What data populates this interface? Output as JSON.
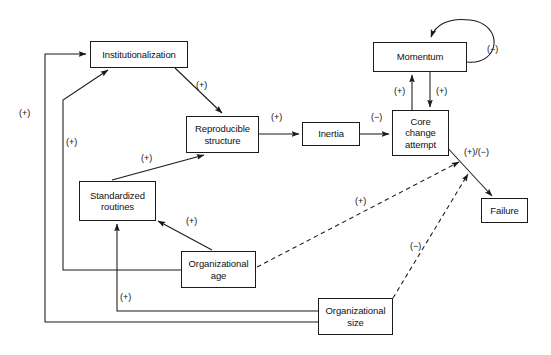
{
  "diagram": {
    "type": "causal-loop-diagram",
    "stroke_color": "#1a1a1a",
    "text_color": "#111111",
    "background": "#ffffff",
    "nodes": [
      {
        "id": "institutionalization",
        "label": "Institutionalization",
        "x": 90,
        "y": 41,
        "w": 98,
        "h": 27
      },
      {
        "id": "reproducible_structure",
        "label": "Reproducible structure",
        "x": 186,
        "y": 116,
        "w": 73,
        "h": 37
      },
      {
        "id": "inertia",
        "label": "Inertia",
        "x": 302,
        "y": 122,
        "w": 58,
        "h": 24
      },
      {
        "id": "core_change_attempt",
        "label": "Core change attempt",
        "x": 392,
        "y": 110,
        "w": 57,
        "h": 46
      },
      {
        "id": "momentum",
        "label": "Momentum",
        "x": 373,
        "y": 42,
        "w": 94,
        "h": 30
      },
      {
        "id": "failure",
        "label": "Failure",
        "x": 481,
        "y": 198,
        "w": 47,
        "h": 25
      },
      {
        "id": "standardized_routines",
        "label": "Standardized routines",
        "x": 79,
        "y": 181,
        "w": 77,
        "h": 40
      },
      {
        "id": "organizational_age",
        "label": "Organizational age",
        "x": 181,
        "y": 251,
        "w": 75,
        "h": 37
      },
      {
        "id": "organizational_size",
        "label": "Organizational size",
        "x": 318,
        "y": 298,
        "w": 75,
        "h": 37
      }
    ],
    "edge_labels": [
      {
        "id": "lbl-inst-repro",
        "text": "(+)",
        "x": 196,
        "y": 80
      },
      {
        "id": "lbl-repro-inertia",
        "text": "(+)",
        "x": 271,
        "y": 112
      },
      {
        "id": "lbl-inertia-core",
        "text": "(−)",
        "x": 371,
        "y": 112
      },
      {
        "id": "lbl-core-momentum",
        "text": "(+)",
        "x": 394,
        "y": 86
      },
      {
        "id": "lbl-momentum-core",
        "text": "(+)",
        "x": 436,
        "y": 86
      },
      {
        "id": "lbl-momentum-self",
        "text": "(−)",
        "x": 487,
        "y": 44
      },
      {
        "id": "lbl-core-failure",
        "text": "(+)/(−)",
        "x": 464,
        "y": 147
      },
      {
        "id": "lbl-size-inst",
        "text": "(+)",
        "x": 19,
        "y": 108
      },
      {
        "id": "lbl-age-inst",
        "text": "(+)",
        "x": 66,
        "y": 137
      },
      {
        "id": "lbl-routines-repro",
        "text": "(+)",
        "x": 141,
        "y": 153
      },
      {
        "id": "lbl-age-routines",
        "text": "(+)",
        "x": 186,
        "y": 216
      },
      {
        "id": "lbl-size-routines",
        "text": "(+)",
        "x": 120,
        "y": 292
      },
      {
        "id": "lbl-age-moderator",
        "text": "(+)",
        "x": 355,
        "y": 196
      },
      {
        "id": "lbl-size-moderator",
        "text": "(−)",
        "x": 410,
        "y": 241
      }
    ],
    "edges": [
      {
        "id": "inst-to-repro",
        "from": "institutionalization",
        "to": "reproducible_structure",
        "sign": "+",
        "style": "solid"
      },
      {
        "id": "repro-to-inertia",
        "from": "reproducible_structure",
        "to": "inertia",
        "sign": "+",
        "style": "solid"
      },
      {
        "id": "inertia-to-core",
        "from": "inertia",
        "to": "core_change_attempt",
        "sign": "−",
        "style": "solid"
      },
      {
        "id": "core-to-momentum",
        "from": "core_change_attempt",
        "to": "momentum",
        "sign": "+",
        "style": "solid"
      },
      {
        "id": "momentum-to-core",
        "from": "momentum",
        "to": "core_change_attempt",
        "sign": "+",
        "style": "solid"
      },
      {
        "id": "momentum-self-loop",
        "from": "momentum",
        "to": "momentum",
        "sign": "−",
        "style": "solid"
      },
      {
        "id": "core-to-failure",
        "from": "core_change_attempt",
        "to": "failure",
        "sign": "+/−",
        "style": "solid"
      },
      {
        "id": "routines-to-repro",
        "from": "standardized_routines",
        "to": "reproducible_structure",
        "sign": "+",
        "style": "solid"
      },
      {
        "id": "age-to-routines",
        "from": "organizational_age",
        "to": "standardized_routines",
        "sign": "+",
        "style": "solid"
      },
      {
        "id": "age-to-inst",
        "from": "organizational_age",
        "to": "institutionalization",
        "sign": "+",
        "style": "solid"
      },
      {
        "id": "size-to-routines",
        "from": "organizational_size",
        "to": "standardized_routines",
        "sign": "+",
        "style": "solid"
      },
      {
        "id": "size-to-inst",
        "from": "organizational_size",
        "to": "institutionalization",
        "sign": "+",
        "style": "solid"
      },
      {
        "id": "age-moderates-failure",
        "from": "organizational_age",
        "to": "core-to-failure",
        "sign": "+",
        "style": "dashed"
      },
      {
        "id": "size-moderates-failure",
        "from": "organizational_size",
        "to": "core-to-failure",
        "sign": "−",
        "style": "dashed"
      }
    ]
  }
}
